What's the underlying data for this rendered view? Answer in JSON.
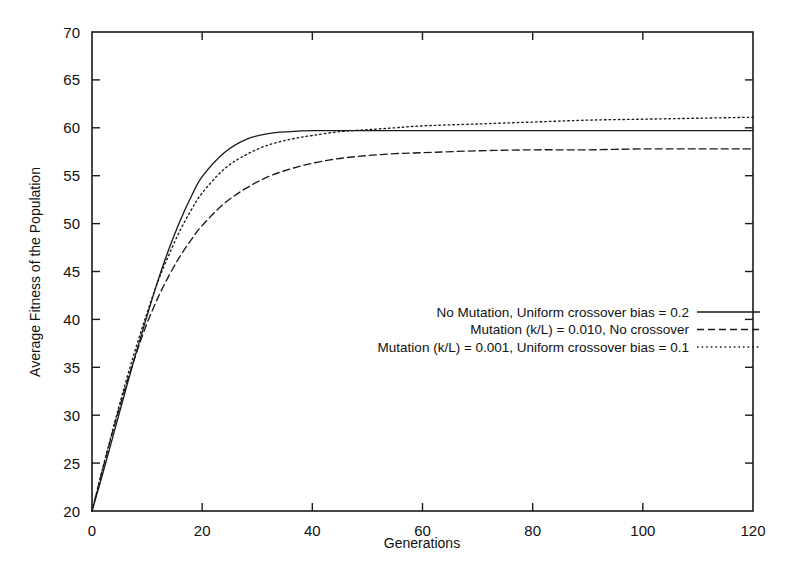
{
  "chart_data": {
    "type": "line",
    "title": "",
    "xlabel": "Generations",
    "ylabel": "Average Fitness of the Population",
    "xlim": [
      0,
      120
    ],
    "ylim": [
      20,
      70
    ],
    "xticks": [
      0,
      20,
      40,
      60,
      80,
      100,
      120
    ],
    "yticks": [
      20,
      25,
      30,
      35,
      40,
      45,
      50,
      55,
      60,
      65,
      70
    ],
    "grid": false,
    "legend_position": "center-right-inside",
    "x": [
      0,
      2,
      4,
      6,
      8,
      10,
      12,
      14,
      16,
      18,
      20,
      24,
      28,
      32,
      36,
      40,
      45,
      50,
      55,
      60,
      70,
      80,
      90,
      100,
      110,
      120
    ],
    "series": [
      {
        "name": "No Mutation, Uniform crossover bias = 0.2",
        "style": "solid",
        "values": [
          20.0,
          24.0,
          28.2,
          32.4,
          36.5,
          40.4,
          44.1,
          47.4,
          50.3,
          52.8,
          54.9,
          57.4,
          58.8,
          59.4,
          59.6,
          59.7,
          59.7,
          59.7,
          59.7,
          59.7,
          59.7,
          59.7,
          59.7,
          59.7,
          59.7,
          59.7
        ]
      },
      {
        "name": "Mutation (k/L) = 0.010, No crossover",
        "style": "dashed",
        "values": [
          20.0,
          24.5,
          28.8,
          32.8,
          36.4,
          39.6,
          42.3,
          44.6,
          46.6,
          48.3,
          49.8,
          52.1,
          53.7,
          54.9,
          55.7,
          56.3,
          56.8,
          57.1,
          57.3,
          57.4,
          57.6,
          57.7,
          57.7,
          57.8,
          57.8,
          57.8
        ]
      },
      {
        "name": "Mutation (k/L) = 0.001, Uniform crossover bias = 0.1",
        "style": "dotted",
        "values": [
          20.0,
          24.6,
          29.0,
          33.2,
          37.1,
          40.7,
          44.0,
          46.8,
          49.3,
          51.4,
          53.2,
          55.7,
          57.2,
          58.2,
          58.8,
          59.2,
          59.6,
          59.8,
          60.0,
          60.2,
          60.4,
          60.6,
          60.8,
          60.9,
          61.0,
          61.1
        ]
      }
    ]
  },
  "axis": {
    "y_title": "Average Fitness of the Population",
    "x_title": "Generations",
    "y_tick_labels": [
      "70",
      "65",
      "60",
      "55",
      "50",
      "45",
      "40",
      "35",
      "30",
      "25",
      "20"
    ],
    "x_tick_labels": [
      "0",
      "20",
      "40",
      "60",
      "80",
      "100",
      "120"
    ]
  },
  "legend": {
    "entries": [
      {
        "label": "No Mutation, Uniform crossover bias = 0.2",
        "style": "solid"
      },
      {
        "label": "Mutation (k/L) = 0.010, No crossover",
        "style": "dashed"
      },
      {
        "label": "Mutation (k/L) = 0.001, Uniform crossover bias = 0.1",
        "style": "dotted"
      }
    ]
  },
  "colors": {
    "ink": "#1a1a1a",
    "background": "#ffffff"
  }
}
